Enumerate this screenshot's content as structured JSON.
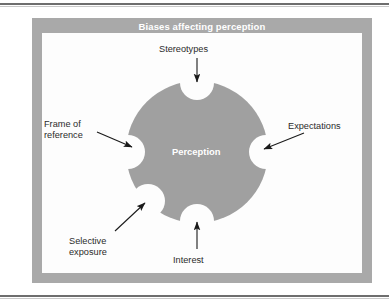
{
  "figure": {
    "title": "Biases affecting perception",
    "center_label": "Perception",
    "shape": "circle-with-five-notches",
    "colors": {
      "frame": "#a9a9a9",
      "panel": "#fdfdfd",
      "circle": "#a0a0a0",
      "notch": "#fdfdfd",
      "title_text": "#ffffff",
      "label_text": "#2b2b2b",
      "arrow": "#1a1a1a",
      "rule": "#6e6e6e"
    }
  },
  "labels": {
    "stereotypes": "Stereotypes",
    "frame_of_reference_line1": "Frame of",
    "frame_of_reference_line2": "reference",
    "expectations": "Expectations",
    "selective_exposure_line1": "Selective",
    "selective_exposure_line2": "exposure",
    "interest": "Interest"
  },
  "diagram_data": {
    "type": "diagram",
    "center": "Perception",
    "factors": [
      {
        "name": "Stereotypes",
        "position": "top",
        "arrow": "down"
      },
      {
        "name": "Frame of reference",
        "position": "left",
        "arrow": "right"
      },
      {
        "name": "Expectations",
        "position": "right",
        "arrow": "left"
      },
      {
        "name": "Selective exposure",
        "position": "bottom-left",
        "arrow": "up-right"
      },
      {
        "name": "Interest",
        "position": "bottom",
        "arrow": "up"
      }
    ],
    "notch_count": 5
  }
}
